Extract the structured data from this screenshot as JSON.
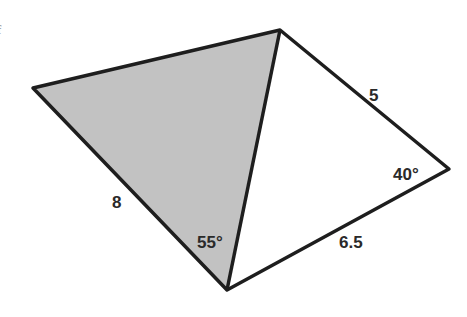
{
  "diagram": {
    "type": "quadrilateral-with-diagonal",
    "colors": {
      "shaded_fill": "#c2c2c2",
      "stroke": "#1e1e1e",
      "background": "#ffffff"
    },
    "vertices": {
      "left": {
        "x": 33,
        "y": 88
      },
      "top": {
        "x": 280,
        "y": 30
      },
      "right": {
        "x": 449,
        "y": 169
      },
      "bottom": {
        "x": 227,
        "y": 290
      }
    },
    "shaded_triangle": [
      "left",
      "top",
      "bottom"
    ],
    "labels": {
      "side_left_bottom": "8",
      "side_top_right": "5",
      "side_right_bottom": "6.5",
      "angle_bottom": "55°",
      "angle_right": "40°"
    },
    "edge_fragment": "f"
  }
}
